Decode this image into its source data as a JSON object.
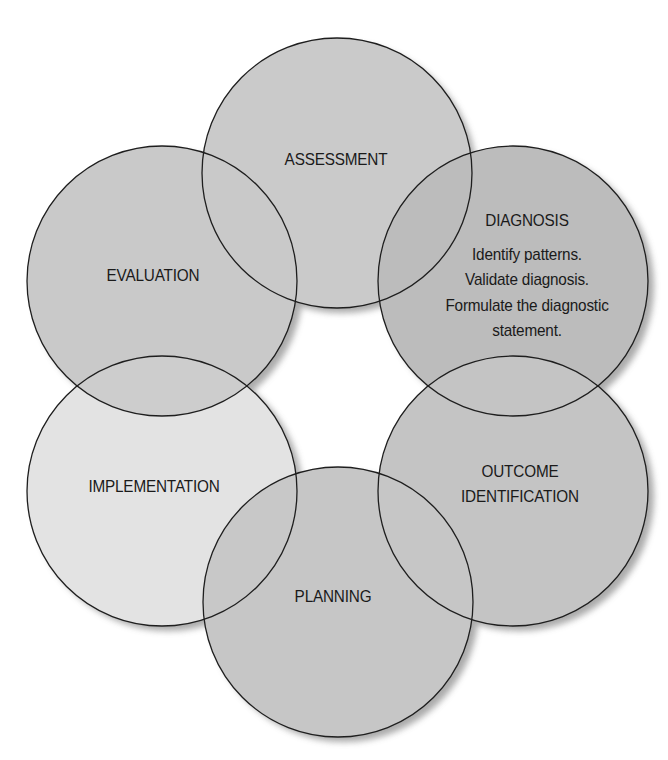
{
  "diagram": {
    "type": "cycle",
    "colors": {
      "background": "#ffffff",
      "circle_fill": "#c9c9c9",
      "diagnosis_fill": "#bababa",
      "implementation_fill": "#e2e2e2",
      "overlap_fill": "#c2c2c2",
      "stroke": "#1e1e1e",
      "shadow": "#9a9a9a",
      "text": "#1a1a1a"
    },
    "nodes": [
      {
        "id": "assessment",
        "label": "ASSESSMENT"
      },
      {
        "id": "diagnosis",
        "label": "DIAGNOSIS",
        "details": [
          "Identify patterns.",
          "Validate diagnosis.",
          "Formulate the diagnostic",
          "statement."
        ]
      },
      {
        "id": "outcome-identification",
        "label_lines": [
          "OUTCOME",
          "IDENTIFICATION"
        ]
      },
      {
        "id": "planning",
        "label": "PLANNING"
      },
      {
        "id": "implementation",
        "label": "IMPLEMENTATION"
      },
      {
        "id": "evaluation",
        "label": "EVALUATION"
      }
    ]
  }
}
